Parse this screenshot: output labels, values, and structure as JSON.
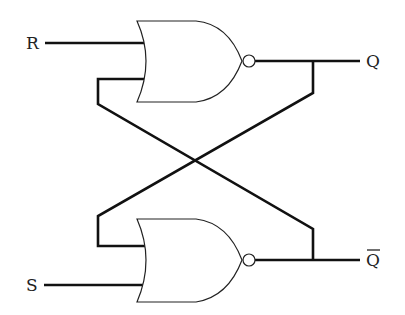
{
  "diagram": {
    "type": "logic-circuit",
    "gates": [
      {
        "id": "nor-top",
        "kind": "NOR",
        "inputs": [
          "R",
          "Q-bar (feedback)"
        ],
        "output": "Q"
      },
      {
        "id": "nor-bottom",
        "kind": "NOR",
        "inputs": [
          "Q (feedback)",
          "S"
        ],
        "output": "Q-bar"
      }
    ],
    "labels": {
      "r_input": "R",
      "s_input": "S",
      "q_output": "Q",
      "qbar_output": "Q"
    },
    "colors": {
      "line": "#111111",
      "background": "#ffffff"
    }
  }
}
